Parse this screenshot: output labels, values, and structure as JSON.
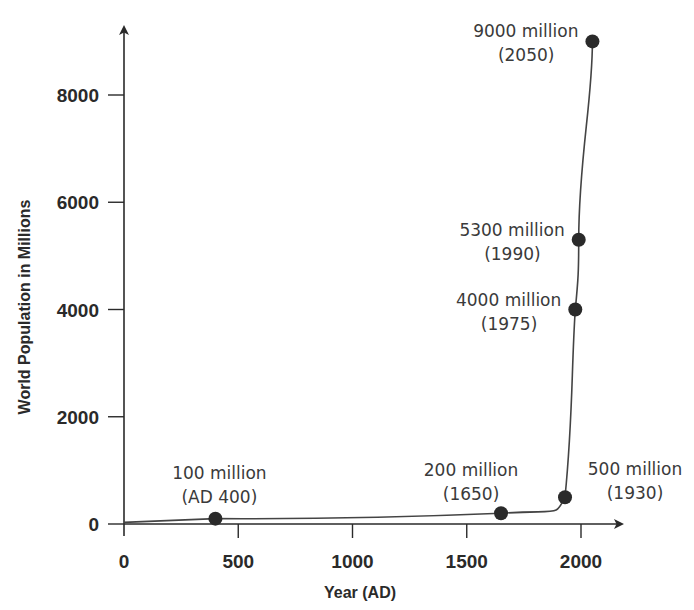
{
  "chart_data": {
    "type": "line",
    "title": "",
    "xlabel": "Year (AD)",
    "ylabel": "World Population in Millions",
    "xlim": [
      0,
      2100
    ],
    "ylim": [
      0,
      9300
    ],
    "x_ticks": [
      0,
      500,
      1000,
      1500,
      2000
    ],
    "x_tick_labels": [
      "0",
      "500",
      "1000",
      "1500",
      "2000"
    ],
    "y_ticks": [
      0,
      2000,
      4000,
      6000,
      8000
    ],
    "y_tick_labels": [
      "0",
      "2000",
      "4000",
      "6000",
      "8000"
    ],
    "grid": false,
    "series": [
      {
        "name": "World Population",
        "x": [
          0,
          400,
          1650,
          1930,
          1975,
          1990,
          2050
        ],
        "y": [
          30,
          100,
          200,
          500,
          4000,
          5300,
          9000
        ]
      }
    ],
    "points": [
      {
        "x": 400,
        "y": 100,
        "label": [
          "100 million",
          "(AD 400)"
        ],
        "anchor": "above"
      },
      {
        "x": 1650,
        "y": 200,
        "label": [
          "200 million",
          "(1650)"
        ],
        "anchor": "above-left"
      },
      {
        "x": 1930,
        "y": 500,
        "label": [
          "500 million",
          "(1930)"
        ],
        "anchor": "right"
      },
      {
        "x": 1975,
        "y": 4000,
        "label": [
          "4000 million",
          "(1975)"
        ],
        "anchor": "left"
      },
      {
        "x": 1990,
        "y": 5300,
        "label": [
          "5300 million",
          "(1990)"
        ],
        "anchor": "left"
      },
      {
        "x": 2050,
        "y": 9000,
        "label": [
          "9000 million",
          "(2050)"
        ],
        "anchor": "left"
      }
    ]
  }
}
